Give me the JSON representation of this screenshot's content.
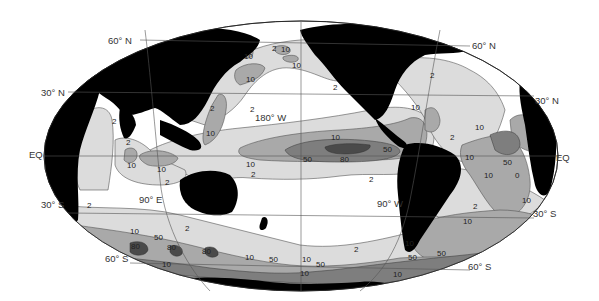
{
  "map": {
    "projection": "elliptical-pacific-centered",
    "contour_levels": [
      "2",
      "10",
      "50",
      "80"
    ],
    "colors": {
      "ocean_below_2": "#ffffff",
      "level_2": "#dcdcdc",
      "level_10": "#a9a9a9",
      "level_50": "#7e7e7e",
      "level_80": "#4a4a4a",
      "land": "#000000",
      "grid": "#555555"
    },
    "latitude_labels": {
      "n60_left": "60° N",
      "n30_left": "30° N",
      "eq_left": "EQ",
      "s30_left": "30° S",
      "s60_left": "60° S",
      "n60_right": "60° N",
      "n30_right": "30° N",
      "eq_right": "EQ",
      "s30_right": "30° S",
      "s60_right": "60° S"
    },
    "longitude_labels": {
      "e90": "90° E",
      "w180": "180° W",
      "w90": "90° W"
    },
    "contour_labels": [
      {
        "id": "nw-pac-1",
        "text": "10"
      },
      {
        "id": "nw-pac-2",
        "text": "2"
      },
      {
        "id": "nw-pac-3",
        "text": "10"
      },
      {
        "id": "nw-pac-4",
        "text": "10"
      },
      {
        "id": "nw-pac-5",
        "text": "10"
      },
      {
        "id": "kuroshio-2",
        "text": "2"
      },
      {
        "id": "kuroshio-10",
        "text": "10"
      },
      {
        "id": "npac-2",
        "text": "2"
      },
      {
        "id": "arabian-2",
        "text": "2"
      },
      {
        "id": "bay-bengal-2",
        "text": "2"
      },
      {
        "id": "io-10a",
        "text": "10"
      },
      {
        "id": "io-10b",
        "text": "10"
      },
      {
        "id": "io-2",
        "text": "2"
      },
      {
        "id": "eqpac-10-n",
        "text": "10"
      },
      {
        "id": "eqpac-10-w",
        "text": "10"
      },
      {
        "id": "eqpac-2-w",
        "text": "2"
      },
      {
        "id": "eqpac-50-w",
        "text": "50"
      },
      {
        "id": "eqpac-80",
        "text": "80"
      },
      {
        "id": "eqpac-50-e",
        "text": "50"
      },
      {
        "id": "eqpac-2-s",
        "text": "2"
      },
      {
        "id": "nepac-2",
        "text": "2"
      },
      {
        "id": "natl-2-n",
        "text": "2"
      },
      {
        "id": "carib-10",
        "text": "10"
      },
      {
        "id": "natl-2-s",
        "text": "2"
      },
      {
        "id": "natl-10",
        "text": "10"
      },
      {
        "id": "eqatl-10",
        "text": "10"
      },
      {
        "id": "eqatl-50",
        "text": "50"
      },
      {
        "id": "satl-10a",
        "text": "10"
      },
      {
        "id": "satl-0",
        "text": "0"
      },
      {
        "id": "satl-10b",
        "text": "10"
      },
      {
        "id": "satl-2",
        "text": "2"
      },
      {
        "id": "sio-2",
        "text": "2"
      },
      {
        "id": "so-2",
        "text": "2"
      },
      {
        "id": "so-10a",
        "text": "10"
      },
      {
        "id": "so-50a",
        "text": "50"
      },
      {
        "id": "so-80a",
        "text": "80"
      },
      {
        "id": "so-80b",
        "text": "80"
      },
      {
        "id": "so-80c",
        "text": "80"
      },
      {
        "id": "so-10b",
        "text": "10"
      },
      {
        "id": "so-10c",
        "text": "10"
      },
      {
        "id": "so-50b",
        "text": "50"
      },
      {
        "id": "so-10d",
        "text": "10"
      },
      {
        "id": "so-50c",
        "text": "50"
      },
      {
        "id": "so-2b",
        "text": "2"
      },
      {
        "id": "so-10e",
        "text": "10"
      },
      {
        "id": "so-50d",
        "text": "50"
      },
      {
        "id": "so-10f",
        "text": "10"
      },
      {
        "id": "so-50e",
        "text": "50"
      },
      {
        "id": "so-10g",
        "text": "10"
      },
      {
        "id": "so-10h",
        "text": "10"
      }
    ]
  }
}
